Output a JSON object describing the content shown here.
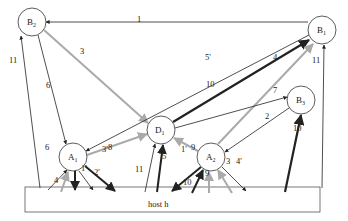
{
  "diagram": {
    "nodes": [
      {
        "id": "B2",
        "label": "B",
        "sub": "2",
        "cx": 32,
        "cy": 22
      },
      {
        "id": "B1",
        "label": "B",
        "sub": "1",
        "cx": 322,
        "cy": 30
      },
      {
        "id": "D1",
        "label": "D",
        "sub": "1",
        "cx": 161,
        "cy": 130
      },
      {
        "id": "B3",
        "label": "B",
        "sub": "3",
        "cx": 301,
        "cy": 100
      },
      {
        "id": "A1",
        "label": "A",
        "sub": "1",
        "cx": 73,
        "cy": 157
      },
      {
        "id": "A2",
        "label": "A",
        "sub": "2",
        "cx": 211,
        "cy": 157
      }
    ],
    "host": {
      "label": "host h",
      "x": 25,
      "y": 187,
      "w": 295,
      "h": 25
    },
    "edge_labels": [
      {
        "text": "1",
        "x": 137,
        "y": 22
      },
      {
        "text": "3",
        "x": 80,
        "y": 54
      },
      {
        "text": "5'",
        "x": 205,
        "y": 60
      },
      {
        "text": "4",
        "x": 273,
        "y": 60
      },
      {
        "text": "11",
        "x": 9,
        "y": 63
      },
      {
        "text": "11",
        "x": 312,
        "y": 63
      },
      {
        "text": "6",
        "x": 46,
        "y": 88
      },
      {
        "text": "10",
        "x": 206,
        "y": 87
      },
      {
        "text": "7",
        "x": 273,
        "y": 93
      },
      {
        "text": "8",
        "x": 108,
        "y": 150
      },
      {
        "text": "9",
        "x": 191,
        "y": 150
      },
      {
        "text": "2",
        "x": 265,
        "y": 119
      },
      {
        "text": "6",
        "x": 45,
        "y": 150
      },
      {
        "text": "3'",
        "x": 102,
        "y": 152
      },
      {
        "text": "10",
        "x": 293,
        "y": 131
      },
      {
        "text": "1'",
        "x": 181,
        "y": 152
      },
      {
        "text": "5",
        "x": 162,
        "y": 159
      },
      {
        "text": "3",
        "x": 226,
        "y": 164
      },
      {
        "text": "4'",
        "x": 236,
        "y": 164
      },
      {
        "text": "11",
        "x": 135,
        "y": 172
      },
      {
        "text": "1'",
        "x": 81,
        "y": 171
      },
      {
        "text": "2'",
        "x": 94,
        "y": 175
      },
      {
        "text": "9",
        "x": 205,
        "y": 176
      },
      {
        "text": "4",
        "x": 54,
        "y": 183
      },
      {
        "text": "10",
        "x": 183,
        "y": 185
      }
    ]
  }
}
